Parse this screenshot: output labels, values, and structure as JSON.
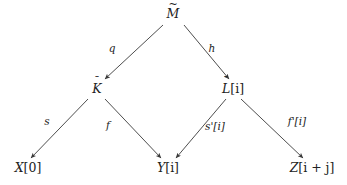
{
  "diagram": {
    "type": "commutative-diagram",
    "title": "",
    "background_color": "#ffffff",
    "stroke_color": "#3a3a3a",
    "text_color": "#222222",
    "width": 347,
    "height": 185,
    "nodes": [
      {
        "id": "M",
        "base": "M",
        "accent": "tilde",
        "accent_glyph": "~",
        "suffix": "",
        "label": "M̃",
        "x": 173,
        "y": 14,
        "row": "top"
      },
      {
        "id": "K",
        "base": "K",
        "accent": "bar",
        "accent_glyph": "¯",
        "suffix": "",
        "label": "K̄",
        "x": 97,
        "y": 89,
        "row": "middle"
      },
      {
        "id": "L",
        "base": "L",
        "accent": "bar",
        "accent_glyph": "¯",
        "suffix": "[i]",
        "label": "L̄[i]",
        "x": 233,
        "y": 89,
        "row": "middle"
      },
      {
        "id": "X",
        "base": "X",
        "accent": "none",
        "accent_glyph": "",
        "suffix": "[0]",
        "label": "X[0]",
        "x": 28,
        "y": 168,
        "row": "bottom"
      },
      {
        "id": "Y",
        "base": "Y",
        "accent": "none",
        "accent_glyph": "",
        "suffix": "[i]",
        "label": "Y[i]",
        "x": 168,
        "y": 168,
        "row": "bottom"
      },
      {
        "id": "Z",
        "base": "Z",
        "accent": "none",
        "accent_glyph": "",
        "suffix": "[i + j]",
        "label": "Z[i + j]",
        "x": 312,
        "y": 168,
        "row": "bottom"
      }
    ],
    "edges": [
      {
        "id": "M-to-K",
        "from": "M",
        "to": "K",
        "label": "q",
        "label_x": 112,
        "label_y": 48,
        "x1": 163,
        "y1": 25,
        "x2": 105,
        "y2": 79,
        "arrowhead": "end"
      },
      {
        "id": "M-to-L",
        "from": "M",
        "to": "L",
        "label": "h",
        "label_x": 212,
        "label_y": 48,
        "x1": 184,
        "y1": 25,
        "x2": 229,
        "y2": 79,
        "arrowhead": "end"
      },
      {
        "id": "K-to-X",
        "from": "K",
        "to": "X",
        "label": "s",
        "label_x": 47,
        "label_y": 121,
        "x1": 88,
        "y1": 99,
        "x2": 31,
        "y2": 158,
        "arrowhead": "end"
      },
      {
        "id": "K-to-Y",
        "from": "K",
        "to": "Y",
        "label": "f",
        "label_x": 108,
        "label_y": 125,
        "x1": 105,
        "y1": 99,
        "x2": 161,
        "y2": 158,
        "arrowhead": "end"
      },
      {
        "id": "L-to-Y",
        "from": "L",
        "to": "Y",
        "label": "s'[i]",
        "label_x": 215,
        "label_y": 126,
        "x1": 226,
        "y1": 99,
        "x2": 176,
        "y2": 158,
        "arrowhead": "end"
      },
      {
        "id": "L-to-Z",
        "from": "L",
        "to": "Z",
        "label": "f'[i]",
        "label_x": 297,
        "label_y": 121,
        "x1": 241,
        "y1": 99,
        "x2": 303,
        "y2": 158,
        "arrowhead": "end"
      }
    ]
  }
}
